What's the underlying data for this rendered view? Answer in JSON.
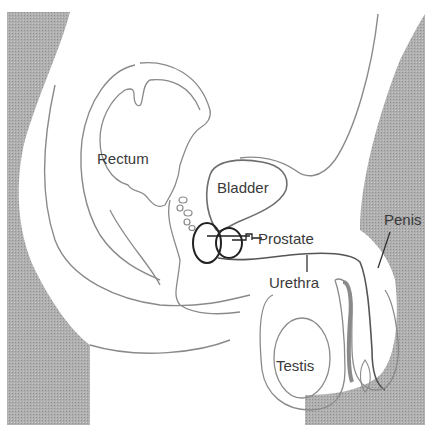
{
  "diagram": {
    "colors": {
      "background": "#ffffff",
      "shade": "#a9a9a9",
      "outline": "#8a8a8a",
      "prostate_outline": "#222222",
      "text": "#3a3a3a"
    },
    "labels": {
      "rectum": "Rectum",
      "bladder": "Bladder",
      "prostate": "Prostate",
      "urethra": "Urethra",
      "penis": "Penis",
      "testis": "Testis"
    }
  }
}
